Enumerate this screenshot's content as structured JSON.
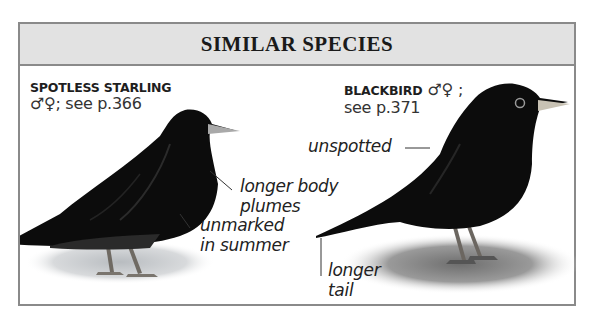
{
  "header": {
    "title": "SIMILAR SPECIES"
  },
  "species": [
    {
      "name": "SPOTLESS STARLING",
      "sex_symbols": "♂♀",
      "reference": "; see p.366",
      "annotations": [
        {
          "text_line1": "longer body",
          "text_line2": "plumes"
        },
        {
          "text_line1": "unmarked",
          "text_line2": "in summer"
        }
      ]
    },
    {
      "name": "BLACKBIRD",
      "sex_symbols": "♂♀",
      "reference_line1": ";",
      "reference_line2": "see p.371",
      "annotations": [
        {
          "text_line1": "unspotted"
        },
        {
          "text_line1": "longer",
          "text_line2": "tail"
        }
      ]
    }
  ],
  "colors": {
    "header_bg": "#e2e2e2",
    "border": "#8a8a8a",
    "bird": "#0c0c0c"
  }
}
